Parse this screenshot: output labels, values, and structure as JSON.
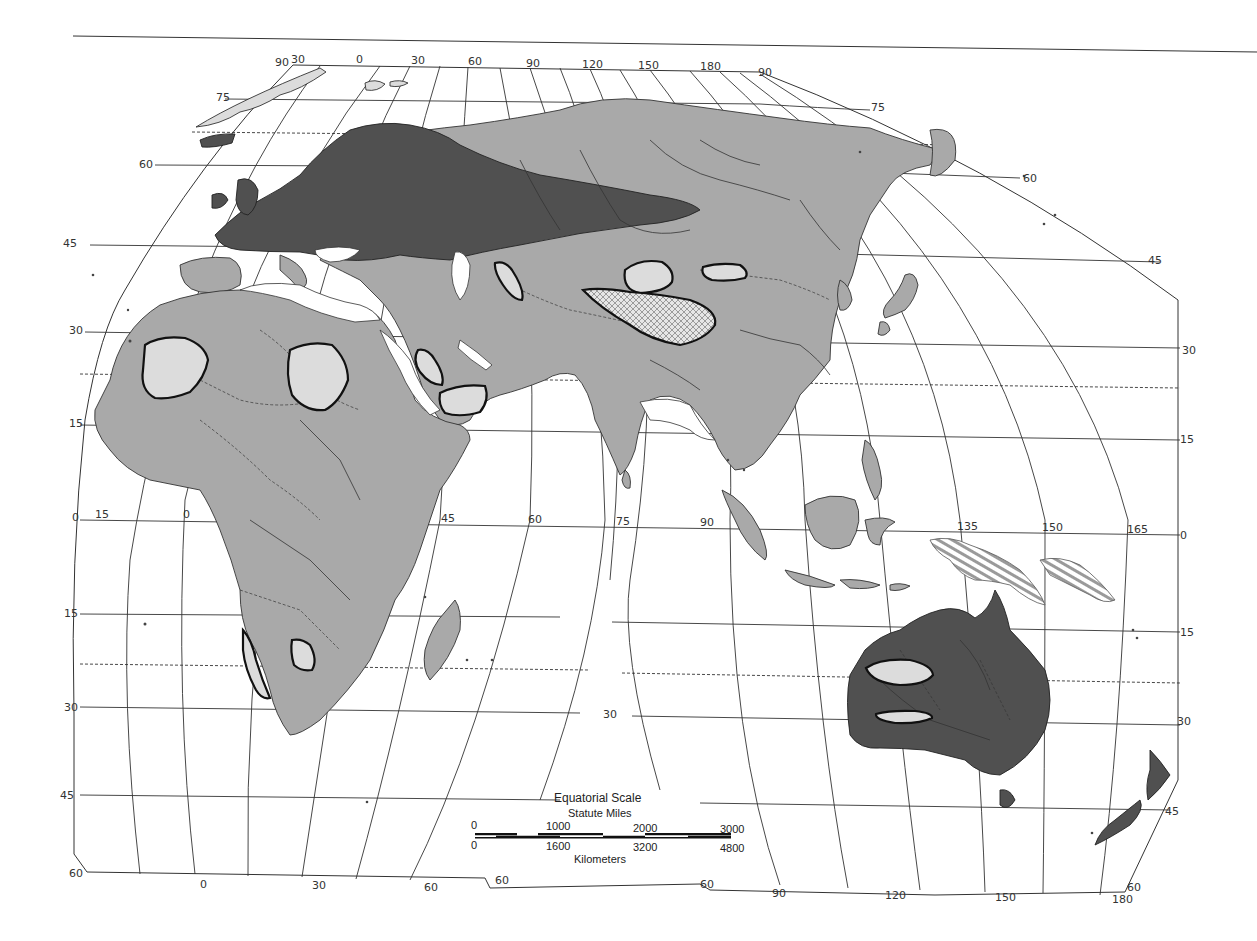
{
  "map": {
    "projection_note": "Eastern Hemisphere, interrupted projection",
    "colors": {
      "background": "#ffffff",
      "land": "#a9a9a9",
      "land_dark": "#505050",
      "light_region": "#dcdcdc",
      "line": "#333333"
    },
    "top_meridian_labels": [
      {
        "text": "90",
        "x": 275,
        "y": 66
      },
      {
        "text": "30",
        "x": 291,
        "y": 63
      },
      {
        "text": "0",
        "x": 356,
        "y": 63
      },
      {
        "text": "30",
        "x": 411,
        "y": 64
      },
      {
        "text": "60",
        "x": 468,
        "y": 65
      },
      {
        "text": "90",
        "x": 526,
        "y": 67
      },
      {
        "text": "120",
        "x": 582,
        "y": 68
      },
      {
        "text": "150",
        "x": 638,
        "y": 69
      },
      {
        "text": "180",
        "x": 700,
        "y": 70
      },
      {
        "text": "90",
        "x": 758,
        "y": 76
      }
    ],
    "left_parallel_labels": [
      {
        "text": "75",
        "x": 216,
        "y": 101
      },
      {
        "text": "60",
        "x": 139,
        "y": 168
      },
      {
        "text": "45",
        "x": 63,
        "y": 247
      },
      {
        "text": "30",
        "x": 69,
        "y": 334
      },
      {
        "text": "15",
        "x": 69,
        "y": 427
      },
      {
        "text": "0",
        "x": 72,
        "y": 521
      },
      {
        "text": "15",
        "x": 64,
        "y": 617
      },
      {
        "text": "30",
        "x": 64,
        "y": 711
      },
      {
        "text": "45",
        "x": 60,
        "y": 799
      },
      {
        "text": "60",
        "x": 69,
        "y": 877
      }
    ],
    "right_parallel_labels": [
      {
        "text": "75",
        "x": 871,
        "y": 111
      },
      {
        "text": "60",
        "x": 1023,
        "y": 182
      },
      {
        "text": "45",
        "x": 1148,
        "y": 264
      },
      {
        "text": "30",
        "x": 1182,
        "y": 354
      },
      {
        "text": "15",
        "x": 1180,
        "y": 443
      },
      {
        "text": "0",
        "x": 1180,
        "y": 539
      },
      {
        "text": "15",
        "x": 1180,
        "y": 636
      },
      {
        "text": "30",
        "x": 1177,
        "y": 725
      },
      {
        "text": "45",
        "x": 1165,
        "y": 815
      },
      {
        "text": "60",
        "x": 1127,
        "y": 891
      }
    ],
    "equator_meridian_labels": [
      {
        "text": "15",
        "x": 95,
        "y": 518
      },
      {
        "text": "0",
        "x": 183,
        "y": 518
      },
      {
        "text": "45",
        "x": 441,
        "y": 522
      },
      {
        "text": "60",
        "x": 528,
        "y": 523
      },
      {
        "text": "75",
        "x": 616,
        "y": 525
      },
      {
        "text": "90",
        "x": 700,
        "y": 526
      },
      {
        "text": "135",
        "x": 957,
        "y": 530
      },
      {
        "text": "150",
        "x": 1042,
        "y": 531
      },
      {
        "text": "165",
        "x": 1127,
        "y": 533
      }
    ],
    "interior_labels": [
      {
        "text": "30",
        "x": 603,
        "y": 718
      }
    ],
    "bottom_meridian_labels": [
      {
        "text": "0",
        "x": 200,
        "y": 888
      },
      {
        "text": "30",
        "x": 312,
        "y": 889
      },
      {
        "text": "60",
        "x": 424,
        "y": 891
      },
      {
        "text": "60",
        "x": 495,
        "y": 884
      },
      {
        "text": "60",
        "x": 700,
        "y": 888
      },
      {
        "text": "90",
        "x": 772,
        "y": 897
      },
      {
        "text": "120",
        "x": 885,
        "y": 899
      },
      {
        "text": "150",
        "x": 995,
        "y": 901
      },
      {
        "text": "180",
        "x": 1112,
        "y": 903
      }
    ],
    "scale_bar": {
      "title": "Equatorial Scale",
      "miles_label": "Statute Miles",
      "km_label": "Kilometers",
      "miles_ticks": [
        "0",
        "1000",
        "2000",
        "3000"
      ],
      "km_ticks": [
        "0",
        "1600",
        "3200",
        "4800"
      ]
    }
  }
}
